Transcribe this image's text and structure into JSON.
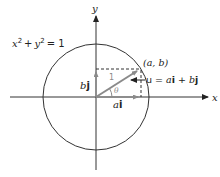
{
  "diagram": {
    "axes": {
      "x_label": "x",
      "y_label": "y"
    },
    "circle": {
      "equation": "x² + y² = 1",
      "eq_x": "x",
      "eq_sup1": "2",
      "eq_plus": "+",
      "eq_y": "y",
      "eq_sup2": "2",
      "eq_rhs": "= 1"
    },
    "point": {
      "label": "(a, b)"
    },
    "vector": {
      "label_u": "u = ",
      "label_ai": "a",
      "label_i": "i",
      "label_plus": " + ",
      "label_b": "b",
      "label_j": "j",
      "magnitude": "1",
      "angle": "θ"
    },
    "components": {
      "horizontal_a": "a",
      "horizontal_i": "i",
      "vertical_b": "b",
      "vertical_j": "j"
    },
    "colors": {
      "line": "#333333",
      "vector": "#8a8a8a",
      "background": "#ffffff"
    }
  }
}
